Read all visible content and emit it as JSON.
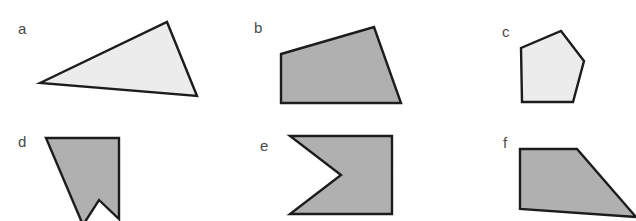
{
  "figure": {
    "width": 636,
    "height": 221,
    "background_color": "#ffffff",
    "stroke_color": "#1c1c1c",
    "stroke_width": 2.4,
    "light_fill": "#ececec",
    "medium_fill": "#b0b0b0"
  },
  "shapes": [
    {
      "id": "a",
      "label": "a",
      "label_x": 18,
      "label_y": 34,
      "kind": "triangle",
      "convex": true,
      "sides": 3,
      "fill": "#ececec",
      "points": "40,83 167,22 197,96"
    },
    {
      "id": "b",
      "label": "b",
      "label_x": 254,
      "label_y": 33,
      "kind": "quadrilateral",
      "convex": true,
      "sides": 4,
      "fill": "#b0b0b0",
      "points": "281,54 374,27 401,103 281,103"
    },
    {
      "id": "c",
      "label": "c",
      "label_x": 502,
      "label_y": 37,
      "kind": "pentagon",
      "convex": true,
      "sides": 5,
      "fill": "#ececec",
      "points": "561,31 584,61 573,102 522,102 521,48"
    },
    {
      "id": "d",
      "label": "d",
      "label_x": 18,
      "label_y": 147,
      "kind": "concave-quadrilateral",
      "convex": false,
      "sides": 5,
      "fill": "#b0b0b0",
      "points": "46,138 119,138 119,219 99,200 83,225 46,138"
    },
    {
      "id": "e",
      "label": "e",
      "label_x": 260,
      "label_y": 151,
      "kind": "concave-pentagon",
      "convex": false,
      "sides": 5,
      "fill": "#b0b0b0",
      "points": "290,136 392,136 392,214 290,214 341,175"
    },
    {
      "id": "f",
      "label": "f",
      "label_x": 503,
      "label_y": 148,
      "kind": "trapezoid",
      "convex": true,
      "sides": 4,
      "fill": "#b0b0b0",
      "points": "520,149 577,149 636,217 520,209"
    }
  ]
}
